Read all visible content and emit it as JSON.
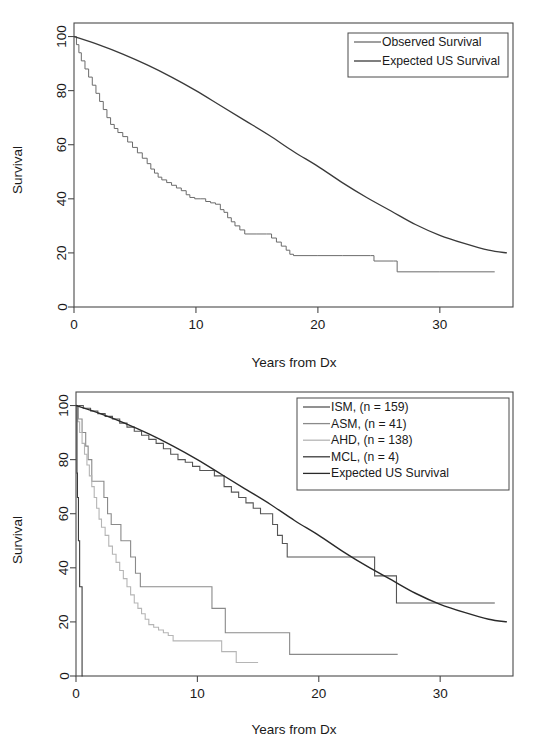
{
  "figure": {
    "background": "#ffffff",
    "panels": [
      "top",
      "bottom"
    ]
  },
  "chart_data": [
    {
      "id": "top",
      "type": "line",
      "title": "",
      "xlabel": "Years from Dx",
      "ylabel": "Survival",
      "xlim": [
        0,
        36
      ],
      "ylim": [
        0,
        105
      ],
      "xticks": [
        0,
        10,
        20,
        30
      ],
      "yticks": [
        0,
        20,
        40,
        60,
        80,
        100
      ],
      "xticklabels": [
        "0",
        "10",
        "20",
        "30"
      ],
      "yticklabels": [
        "0",
        "20",
        "40",
        "60",
        "80",
        "100"
      ],
      "grid": false,
      "legend_position": "top-right",
      "series": [
        {
          "name": "Observed Survival",
          "color": "#6b6b6b",
          "width": 1.0,
          "style": "step",
          "points": [
            [
              0,
              100
            ],
            [
              0.2,
              97
            ],
            [
              0.4,
              94
            ],
            [
              0.6,
              91
            ],
            [
              0.9,
              88
            ],
            [
              1.2,
              85
            ],
            [
              1.5,
              82
            ],
            [
              1.8,
              79
            ],
            [
              2.1,
              76
            ],
            [
              2.4,
              73
            ],
            [
              2.7,
              70
            ],
            [
              3.0,
              67.5
            ],
            [
              3.3,
              66
            ],
            [
              3.6,
              64.5
            ],
            [
              4.0,
              63
            ],
            [
              4.4,
              61
            ],
            [
              4.8,
              59
            ],
            [
              5.2,
              57
            ],
            [
              5.6,
              55
            ],
            [
              6.0,
              53
            ],
            [
              6.3,
              51
            ],
            [
              6.6,
              49.5
            ],
            [
              6.9,
              48
            ],
            [
              7.2,
              47
            ],
            [
              7.6,
              46
            ],
            [
              8.0,
              45
            ],
            [
              8.4,
              44
            ],
            [
              8.8,
              43
            ],
            [
              9.2,
              41.5
            ],
            [
              9.5,
              40.5
            ],
            [
              9.9,
              40
            ],
            [
              10.4,
              40
            ],
            [
              10.8,
              39
            ],
            [
              11.2,
              38.5
            ],
            [
              11.6,
              38
            ],
            [
              12.0,
              36
            ],
            [
              12.3,
              35
            ],
            [
              12.6,
              33
            ],
            [
              12.9,
              31.5
            ],
            [
              13.2,
              30
            ],
            [
              13.6,
              28.5
            ],
            [
              14.0,
              27
            ],
            [
              15.0,
              27
            ],
            [
              15.8,
              27
            ],
            [
              16.2,
              25.5
            ],
            [
              16.6,
              24
            ],
            [
              17.0,
              22.5
            ],
            [
              17.4,
              21
            ],
            [
              17.7,
              19.5
            ],
            [
              18.0,
              19
            ],
            [
              20.0,
              19
            ],
            [
              22.0,
              19
            ],
            [
              24.3,
              19
            ],
            [
              24.6,
              17
            ],
            [
              26.2,
              17
            ],
            [
              26.5,
              13
            ],
            [
              30.0,
              13
            ],
            [
              34.5,
              13
            ]
          ]
        },
        {
          "name": "Expected US Survival",
          "color": "#3a3a3a",
          "width": 1.3,
          "style": "smooth",
          "points": [
            [
              0,
              100
            ],
            [
              2,
              97
            ],
            [
              4,
              93.5
            ],
            [
              6,
              89.5
            ],
            [
              8,
              85
            ],
            [
              10,
              80
            ],
            [
              12,
              74.5
            ],
            [
              14,
              69
            ],
            [
              16,
              63.5
            ],
            [
              18,
              57.5
            ],
            [
              20,
              52
            ],
            [
              22,
              46
            ],
            [
              24,
              40.5
            ],
            [
              26,
              35.5
            ],
            [
              28,
              30.5
            ],
            [
              30,
              26.5
            ],
            [
              32,
              23.5
            ],
            [
              34,
              21
            ],
            [
              35.5,
              20
            ]
          ]
        }
      ]
    },
    {
      "id": "bottom",
      "type": "line",
      "title": "",
      "xlabel": "Years from Dx",
      "ylabel": "Survival",
      "xlim": [
        0,
        36
      ],
      "ylim": [
        0,
        105
      ],
      "xticks": [
        0,
        10,
        20,
        30
      ],
      "yticks": [
        0,
        20,
        40,
        60,
        80,
        100
      ],
      "xticklabels": [
        "0",
        "10",
        "20",
        "30"
      ],
      "yticklabels": [
        "0",
        "20",
        "40",
        "60",
        "80",
        "100"
      ],
      "grid": false,
      "legend_position": "top-right",
      "series": [
        {
          "name": "ISM, (n = 159)",
          "n": 159,
          "color": "#555555",
          "width": 1.1,
          "style": "step",
          "points": [
            [
              0,
              100
            ],
            [
              0.6,
              99
            ],
            [
              1.2,
              98
            ],
            [
              1.8,
              97
            ],
            [
              2.4,
              96
            ],
            [
              3.0,
              95
            ],
            [
              3.6,
              93.5
            ],
            [
              4.2,
              92
            ],
            [
              4.8,
              90.5
            ],
            [
              5.4,
              89
            ],
            [
              6.0,
              87.5
            ],
            [
              6.6,
              86
            ],
            [
              7.2,
              84
            ],
            [
              7.8,
              82
            ],
            [
              8.4,
              80
            ],
            [
              9.0,
              79
            ],
            [
              9.6,
              77.5
            ],
            [
              10.2,
              76
            ],
            [
              10.8,
              76
            ],
            [
              11.4,
              74
            ],
            [
              11.8,
              74
            ],
            [
              12.2,
              70
            ],
            [
              12.8,
              68
            ],
            [
              13.4,
              66
            ],
            [
              14.0,
              64
            ],
            [
              14.6,
              62
            ],
            [
              15.2,
              60
            ],
            [
              15.8,
              60
            ],
            [
              16.2,
              56
            ],
            [
              16.6,
              52
            ],
            [
              17.0,
              49
            ],
            [
              17.4,
              44
            ],
            [
              20.0,
              44
            ],
            [
              22.0,
              44
            ],
            [
              24.2,
              44
            ],
            [
              24.6,
              37
            ],
            [
              26.0,
              37
            ],
            [
              26.4,
              27
            ],
            [
              30.0,
              27
            ],
            [
              34.5,
              27
            ]
          ]
        },
        {
          "name": "ASM, (n = 41)",
          "n": 41,
          "color": "#8a8a8a",
          "width": 1.1,
          "style": "step",
          "points": [
            [
              0,
              100
            ],
            [
              0.2,
              95
            ],
            [
              0.5,
              90
            ],
            [
              0.8,
              85
            ],
            [
              1.0,
              80
            ],
            [
              1.3,
              72
            ],
            [
              2.0,
              72
            ],
            [
              2.3,
              66
            ],
            [
              2.6,
              60
            ],
            [
              2.9,
              56
            ],
            [
              3.4,
              56
            ],
            [
              3.7,
              50
            ],
            [
              4.2,
              50
            ],
            [
              4.5,
              44
            ],
            [
              4.9,
              38
            ],
            [
              5.3,
              33
            ],
            [
              6.0,
              33
            ],
            [
              8.0,
              33
            ],
            [
              10.0,
              33
            ],
            [
              10.8,
              33
            ],
            [
              11.2,
              25
            ],
            [
              12.0,
              25
            ],
            [
              12.3,
              16
            ],
            [
              14.0,
              16
            ],
            [
              16.0,
              16
            ],
            [
              17.3,
              16
            ],
            [
              17.6,
              8
            ],
            [
              20.0,
              8
            ],
            [
              24.0,
              8
            ],
            [
              26.5,
              8
            ]
          ]
        },
        {
          "name": "AHD, (n = 138)",
          "n": 138,
          "color": "#b5b5b5",
          "width": 1.1,
          "style": "step",
          "points": [
            [
              0,
              100
            ],
            [
              0.15,
              94
            ],
            [
              0.3,
              90
            ],
            [
              0.5,
              86
            ],
            [
              0.7,
              82
            ],
            [
              0.9,
              78
            ],
            [
              1.1,
              74
            ],
            [
              1.3,
              70
            ],
            [
              1.5,
              66
            ],
            [
              1.7,
              62
            ],
            [
              1.9,
              58
            ],
            [
              2.1,
              55
            ],
            [
              2.4,
              52
            ],
            [
              2.7,
              48
            ],
            [
              3.0,
              45
            ],
            [
              3.3,
              42
            ],
            [
              3.6,
              39
            ],
            [
              3.9,
              36
            ],
            [
              4.2,
              33
            ],
            [
              4.5,
              30
            ],
            [
              4.8,
              27
            ],
            [
              5.1,
              25
            ],
            [
              5.4,
              23
            ],
            [
              5.7,
              21
            ],
            [
              6.0,
              19
            ],
            [
              6.4,
              18
            ],
            [
              6.8,
              17
            ],
            [
              7.2,
              16
            ],
            [
              7.6,
              15
            ],
            [
              8.0,
              13
            ],
            [
              9.0,
              13
            ],
            [
              10.0,
              13
            ],
            [
              11.0,
              13
            ],
            [
              11.6,
              13
            ],
            [
              12.0,
              9
            ],
            [
              12.8,
              9
            ],
            [
              13.2,
              5
            ],
            [
              14.0,
              5
            ],
            [
              15.0,
              5
            ]
          ]
        },
        {
          "name": "MCL, (n = 4)",
          "n": 4,
          "color": "#3a3a3a",
          "width": 1.1,
          "style": "step",
          "points": [
            [
              0,
              100
            ],
            [
              0.08,
              75
            ],
            [
              0.12,
              66
            ],
            [
              0.2,
              50
            ],
            [
              0.3,
              33
            ],
            [
              0.45,
              33
            ],
            [
              0.5,
              0
            ],
            [
              0.55,
              0
            ]
          ]
        },
        {
          "name": "Expected US Survival",
          "color": "#2a2a2a",
          "width": 1.4,
          "style": "smooth",
          "points": [
            [
              0,
              100
            ],
            [
              2,
              97
            ],
            [
              4,
              93.5
            ],
            [
              6,
              89.5
            ],
            [
              8,
              85
            ],
            [
              10,
              80
            ],
            [
              12,
              74.5
            ],
            [
              14,
              69
            ],
            [
              16,
              63.5
            ],
            [
              18,
              57.5
            ],
            [
              20,
              52
            ],
            [
              22,
              46
            ],
            [
              24,
              40.5
            ],
            [
              26,
              35.5
            ],
            [
              28,
              30.5
            ],
            [
              30,
              26.5
            ],
            [
              32,
              23.5
            ],
            [
              34,
              21
            ],
            [
              35.5,
              20
            ]
          ]
        }
      ]
    }
  ]
}
